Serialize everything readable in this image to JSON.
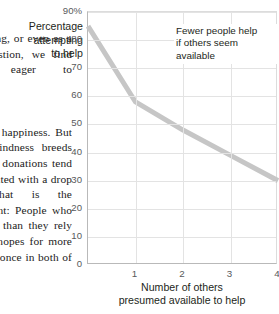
{
  "page": {
    "background_color": "#ffffff"
  },
  "body_text": {
    "paragraphs": [
      "However long, or even as a mere suggestion, we find ourselves eager to",
      "share in the happiness. But that very kindness breeds waves: such donations tend to be associated with a drop (1977). That is the counterweight: People who feel happier than they rely entirely on hopes for more than before, once in both of the."
    ]
  },
  "figure": {
    "y_axis_title_lines": [
      "Percentage",
      "attempting",
      "to help"
    ],
    "x_axis_title_lines": [
      "Number of others",
      "presumed available to help"
    ],
    "annotation_lines": [
      "Fewer people help",
      "if others seem",
      "available"
    ],
    "line_color": "#c6c6c6",
    "grid_color": "#e3e3e3",
    "axis_color": "#b9b9b9",
    "tick_label_color": "#58595b",
    "title_color": "#231f20"
  },
  "chart_data": {
    "type": "line",
    "title": "",
    "xlabel": "Number of others presumed available to help",
    "ylabel": "Percentage attempting to help",
    "x": [
      0,
      1,
      2,
      3,
      4
    ],
    "values": [
      85,
      58,
      48,
      39,
      30
    ],
    "series": [
      {
        "name": "Percentage attempting to help",
        "values": [
          85,
          58,
          48,
          39,
          30
        ]
      }
    ],
    "xlim": [
      0,
      4
    ],
    "ylim": [
      0,
      90
    ],
    "ytick_labels": [
      "90%",
      "80",
      "70",
      "60",
      "50",
      "40",
      "30",
      "20",
      "10",
      "0"
    ],
    "ytick_values": [
      90,
      80,
      70,
      60,
      50,
      40,
      30,
      20,
      10,
      0
    ],
    "xtick_labels": [
      "1",
      "2",
      "3",
      "4"
    ],
    "xtick_values": [
      1,
      2,
      3,
      4
    ],
    "grid": true,
    "legend": "none",
    "annotations": [
      {
        "text": "Fewer people help if others seem available",
        "x": 2.0,
        "y": 83
      }
    ]
  }
}
